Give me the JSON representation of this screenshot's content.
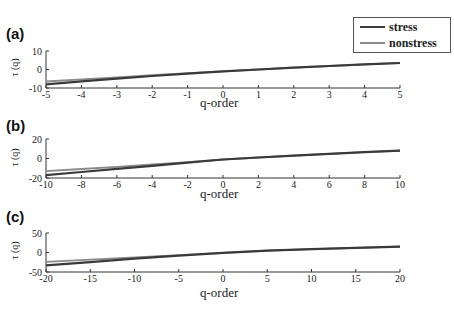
{
  "legend": {
    "items": [
      {
        "label": "stress",
        "color": "#3a3a3a"
      },
      {
        "label": "nonstress",
        "color": "#8a8a8a"
      }
    ]
  },
  "chart_data": [
    {
      "type": "line",
      "panel": "(a)",
      "title": "",
      "xlabel": "q-order",
      "ylabel": "τ (q)",
      "xlim": [
        -5,
        5
      ],
      "ylim": [
        -10,
        10
      ],
      "xticks": [
        -5,
        -4,
        -3,
        -2,
        -1,
        0,
        1,
        2,
        3,
        4,
        5
      ],
      "yticks": [
        -10,
        0,
        10
      ],
      "grid": false,
      "legend_position": "upper right (outside top)",
      "x": [
        -5,
        -4,
        -3,
        -2,
        -1,
        0,
        1,
        2,
        3,
        4,
        5
      ],
      "series": [
        {
          "name": "stress",
          "values": [
            -8.0,
            -6.4,
            -4.9,
            -3.5,
            -2.2,
            -1.0,
            0.0,
            1.0,
            1.9,
            2.8,
            3.5
          ]
        },
        {
          "name": "nonstress",
          "values": [
            -6.5,
            -5.3,
            -4.2,
            -3.1,
            -2.0,
            -1.0,
            0.0,
            1.0,
            1.9,
            2.8,
            3.5
          ]
        }
      ]
    },
    {
      "type": "line",
      "panel": "(b)",
      "title": "",
      "xlabel": "q-order",
      "ylabel": "τ (q)",
      "xlim": [
        -10,
        10
      ],
      "ylim": [
        -20,
        20
      ],
      "xticks": [
        -10,
        -8,
        -6,
        -4,
        -2,
        0,
        2,
        4,
        6,
        8,
        10
      ],
      "yticks": [
        -20,
        0,
        20
      ],
      "grid": false,
      "x": [
        -10,
        -8,
        -6,
        -4,
        -2,
        0,
        2,
        4,
        6,
        8,
        10
      ],
      "series": [
        {
          "name": "stress",
          "values": [
            -17.0,
            -13.8,
            -10.6,
            -7.5,
            -4.3,
            -1.0,
            1.0,
            3.0,
            4.8,
            6.5,
            8.0
          ]
        },
        {
          "name": "nonstress",
          "values": [
            -13.0,
            -10.8,
            -8.5,
            -6.2,
            -3.7,
            -1.0,
            1.0,
            3.0,
            4.8,
            6.5,
            8.0
          ]
        }
      ]
    },
    {
      "type": "line",
      "panel": "(c)",
      "title": "",
      "xlabel": "q-order",
      "ylabel": "τ (q)",
      "xlim": [
        -20,
        20
      ],
      "ylim": [
        -50,
        50
      ],
      "xticks": [
        -20,
        -15,
        -10,
        -5,
        0,
        5,
        10,
        15,
        20
      ],
      "yticks": [
        -50,
        0,
        50
      ],
      "grid": false,
      "x": [
        -20,
        -15,
        -10,
        -5,
        0,
        5,
        10,
        15,
        20
      ],
      "series": [
        {
          "name": "stress",
          "values": [
            -33.0,
            -24.5,
            -16.0,
            -8.0,
            -1.0,
            4.5,
            8.5,
            12.0,
            15.0
          ]
        },
        {
          "name": "nonstress",
          "values": [
            -24.0,
            -18.5,
            -12.8,
            -6.8,
            -1.0,
            4.5,
            8.5,
            12.0,
            15.0
          ]
        }
      ]
    }
  ],
  "panels": [
    {
      "label": "(a)",
      "xlabel": "q-order",
      "ylabel": "τ (q)"
    },
    {
      "label": "(b)",
      "xlabel": "q-order",
      "ylabel": "τ (q)"
    },
    {
      "label": "(c)",
      "xlabel": "q-order",
      "ylabel": "τ (q)"
    }
  ]
}
